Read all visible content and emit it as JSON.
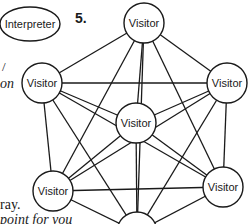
{
  "figure": {
    "number_label": "5.",
    "interpreter": {
      "label": "Interpreter",
      "cx": 30,
      "cy": 24,
      "rx": 30,
      "ry": 17
    },
    "nodes": [
      {
        "id": "top",
        "label": "Visitor",
        "cx": 144,
        "cy": 23,
        "r": 20
      },
      {
        "id": "upper-left",
        "label": "Visitor",
        "cx": 42,
        "cy": 83,
        "r": 20
      },
      {
        "id": "upper-right",
        "label": "Visitor",
        "cx": 227,
        "cy": 83,
        "r": 20
      },
      {
        "id": "center",
        "label": "Visitor",
        "cx": 136,
        "cy": 123,
        "r": 20
      },
      {
        "id": "lower-left",
        "label": "Visitor",
        "cx": 53,
        "cy": 191,
        "r": 20
      },
      {
        "id": "lower-right",
        "label": "Visitor",
        "cx": 223,
        "cy": 187,
        "r": 20
      },
      {
        "id": "bottom",
        "label": "Visitor",
        "cx": 137,
        "cy": 232,
        "r": 20
      }
    ],
    "edges": [
      [
        "top",
        "upper-left"
      ],
      [
        "top",
        "upper-right"
      ],
      [
        "top",
        "center"
      ],
      [
        "top",
        "lower-left"
      ],
      [
        "top",
        "lower-right"
      ],
      [
        "top",
        "bottom"
      ],
      [
        "upper-left",
        "upper-right"
      ],
      [
        "upper-left",
        "center"
      ],
      [
        "upper-left",
        "lower-left"
      ],
      [
        "upper-left",
        "lower-right"
      ],
      [
        "upper-left",
        "bottom"
      ],
      [
        "upper-right",
        "center"
      ],
      [
        "upper-right",
        "lower-left"
      ],
      [
        "upper-right",
        "lower-right"
      ],
      [
        "upper-right",
        "bottom"
      ],
      [
        "center",
        "lower-left"
      ],
      [
        "center",
        "lower-right"
      ],
      [
        "center",
        "bottom"
      ],
      [
        "lower-left",
        "lower-right"
      ],
      [
        "lower-left",
        "bottom"
      ],
      [
        "lower-right",
        "bottom"
      ]
    ]
  },
  "text_fragments": {
    "left_mark": "/",
    "left_italic": "on",
    "bottom_line1": "ray.",
    "bottom_line2": "point for you"
  },
  "colors": {
    "ink": "#1a1a1a",
    "background": "#ffffff"
  }
}
